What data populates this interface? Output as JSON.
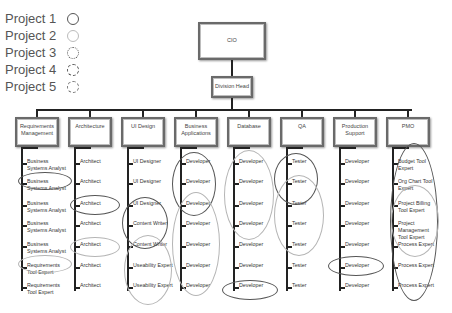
{
  "legend": [
    {
      "label": "Project 1",
      "style": "solid-dark"
    },
    {
      "label": "Project 2",
      "style": "solid-light"
    },
    {
      "label": "Project 3",
      "style": "dotted"
    },
    {
      "label": "Project 4",
      "style": "dashed"
    },
    {
      "label": "Project 5",
      "style": "dash-dot"
    }
  ],
  "org": {
    "root": "CIO",
    "division": "Division Head",
    "departments": [
      {
        "name": "Requirements Management",
        "items": [
          "Business Systems Analyst",
          "Business Systems Analyst",
          "Business Systems Analyst",
          "Business Systems Analyst",
          "Business Systems Analyst",
          "Requirements Tool Expert",
          "Requirements Tool Expert"
        ]
      },
      {
        "name": "Architecture",
        "items": [
          "Architect",
          "Architect",
          "Architect",
          "Architect",
          "Architect",
          "Architect",
          "Architect"
        ]
      },
      {
        "name": "UI Design",
        "items": [
          "UI Designer",
          "UI Designer",
          "UI Designer",
          "Content Writer",
          "Content Writer",
          "Useability Expert",
          "Useability Expert"
        ]
      },
      {
        "name": "Business Applications",
        "items": [
          "Developer",
          "Developer",
          "Developer",
          "Developer",
          "Developer",
          "Developer",
          "Developer"
        ]
      },
      {
        "name": "Database",
        "items": [
          "Developer",
          "Developer",
          "Developer",
          "Developer",
          "Developer",
          "Developer",
          "Developer"
        ]
      },
      {
        "name": "QA",
        "items": [
          "Tester",
          "Tester",
          "Tester",
          "Tester",
          "Tester",
          "Tester",
          "Tester"
        ]
      },
      {
        "name": "Production Support",
        "items": [
          "Developer",
          "Developer",
          "Developer",
          "Developer",
          "Developer",
          "Developer",
          "Developer"
        ]
      },
      {
        "name": "PMO",
        "items": [
          "Budget Tool Expert",
          "Org Chart Tool Expert",
          "Project Billing Tool Expert",
          "Project Management Tool Expert",
          "Process Expert",
          "Process Expert",
          "Process Expert"
        ]
      }
    ]
  },
  "colors": {
    "project1": "#555555",
    "project2": "#b5b5b5",
    "line": "#222222",
    "box_border": "#6a6a6a"
  }
}
